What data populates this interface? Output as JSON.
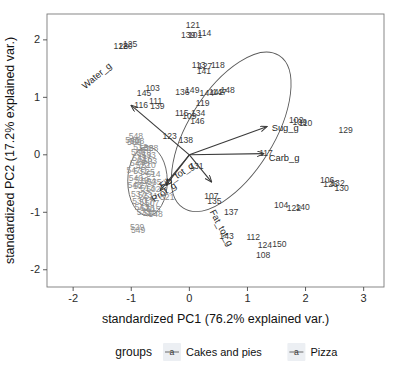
{
  "figure": {
    "type": "pca-biplot",
    "background": "#ffffff",
    "frame_color": "#7a7a7a"
  },
  "axes": {
    "x": {
      "title": "standardized PC1 (76.2% explained var.)",
      "ticks": [
        "-2",
        "-1",
        "0",
        "1",
        "2",
        "3"
      ],
      "tick_values": [
        -2,
        -1,
        0,
        1,
        2,
        3
      ],
      "range": [
        -2.45,
        3.35
      ]
    },
    "y": {
      "title": "standardized PC2 (17.2% explained var.)",
      "ticks": [
        "-2",
        "-1",
        "0",
        "1",
        "2"
      ],
      "tick_values": [
        -2,
        -1,
        0,
        1,
        2
      ],
      "range": [
        -2.3,
        2.45
      ]
    }
  },
  "legend": {
    "title": "groups",
    "items": [
      {
        "label": "Cakes and pies",
        "color": "#4d4d4d"
      },
      {
        "label": "Pizza",
        "color": "#9a9a9a"
      }
    ]
  },
  "chart_data": {
    "type": "scatter",
    "title": "",
    "xlabel": "standardized PC1 (76.2% explained var.)",
    "ylabel": "standardized PC2 (17.2% explained var.)",
    "xlim": [
      -2.45,
      3.35
    ],
    "ylim": [
      -2.3,
      2.45
    ],
    "grid": false,
    "legend_position": "bottom",
    "loadings": [
      {
        "name": "Water_g",
        "x": -1.0,
        "y": 0.86
      },
      {
        "name": "Sug_g",
        "x": 1.33,
        "y": 0.49
      },
      {
        "name": "Carb_g",
        "x": 1.28,
        "y": 0.02
      },
      {
        "name": "Fat_tot_g",
        "x": 0.38,
        "y": -0.47
      },
      {
        "name": "Fib_tot_g",
        "x": -0.4,
        "y": -0.53
      },
      {
        "name": "Prot_g",
        "x": -0.5,
        "y": -0.62
      }
    ],
    "ellipses": [
      {
        "group": "Cakes and pies",
        "cx": 0.72,
        "cy": 0.4,
        "rx": 1.55,
        "ry": 0.74,
        "angle": -58
      },
      {
        "group": "Pizza",
        "cx": -0.72,
        "cy": -0.46,
        "rx": 0.34,
        "ry": 0.6,
        "angle": 0
      }
    ],
    "series": [
      {
        "name": "Cakes and pies",
        "color": "#3a3a3a",
        "points": [
          {
            "label": "121",
            "x": 0.06,
            "y": 2.26
          },
          {
            "label": "114",
            "x": 0.26,
            "y": 2.12
          },
          {
            "label": "139",
            "x": -0.02,
            "y": 2.09
          },
          {
            "label": "101",
            "x": 0.1,
            "y": 2.09
          },
          {
            "label": "128",
            "x": -1.18,
            "y": 1.9
          },
          {
            "label": "120",
            "x": -1.1,
            "y": 1.9
          },
          {
            "label": "125",
            "x": -1.02,
            "y": 1.93
          },
          {
            "label": "113",
            "x": 0.16,
            "y": 1.57
          },
          {
            "label": "127",
            "x": 0.27,
            "y": 1.55
          },
          {
            "label": "118",
            "x": 0.49,
            "y": 1.56
          },
          {
            "label": "141",
            "x": 0.25,
            "y": 1.45
          },
          {
            "label": "103",
            "x": -0.63,
            "y": 1.16
          },
          {
            "label": "145",
            "x": -0.78,
            "y": 1.08
          },
          {
            "label": "136",
            "x": -0.12,
            "y": 1.1
          },
          {
            "label": "149",
            "x": 0.05,
            "y": 1.12
          },
          {
            "label": "144",
            "x": 0.3,
            "y": 1.08
          },
          {
            "label": "142",
            "x": 0.46,
            "y": 1.09
          },
          {
            "label": "147",
            "x": 0.52,
            "y": 1.09
          },
          {
            "label": "148",
            "x": 0.66,
            "y": 1.13
          },
          {
            "label": "116",
            "x": -0.83,
            "y": 0.86
          },
          {
            "label": "111",
            "x": -0.58,
            "y": 0.93
          },
          {
            "label": "139",
            "x": -0.55,
            "y": 0.85
          },
          {
            "label": "119",
            "x": 0.23,
            "y": 0.91
          },
          {
            "label": "115",
            "x": -0.13,
            "y": 0.72
          },
          {
            "label": "109",
            "x": 0.0,
            "y": 0.67
          },
          {
            "label": "134",
            "x": 0.15,
            "y": 0.73
          },
          {
            "label": "146",
            "x": 0.14,
            "y": 0.58
          },
          {
            "label": "102",
            "x": 1.84,
            "y": 0.61
          },
          {
            "label": "109",
            "x": 1.9,
            "y": 0.57
          },
          {
            "label": "110",
            "x": 2.0,
            "y": 0.55
          },
          {
            "label": "129",
            "x": 2.69,
            "y": 0.44
          },
          {
            "label": "123",
            "x": -0.34,
            "y": 0.33
          },
          {
            "label": "138",
            "x": -0.06,
            "y": 0.25
          },
          {
            "label": "117",
            "x": 1.32,
            "y": 0.03
          },
          {
            "label": "131",
            "x": 0.12,
            "y": -0.19
          },
          {
            "label": "106",
            "x": 2.37,
            "y": -0.44
          },
          {
            "label": "126",
            "x": 2.43,
            "y": -0.5
          },
          {
            "label": "132",
            "x": 2.55,
            "y": -0.49
          },
          {
            "label": "130",
            "x": 2.62,
            "y": -0.58
          },
          {
            "label": "107",
            "x": 0.38,
            "y": -0.72
          },
          {
            "label": "135",
            "x": 0.43,
            "y": -0.8
          },
          {
            "label": "104",
            "x": 1.58,
            "y": -0.87
          },
          {
            "label": "122",
            "x": 1.8,
            "y": -0.92
          },
          {
            "label": "140",
            "x": 1.95,
            "y": -0.91
          },
          {
            "label": "137",
            "x": 0.72,
            "y": -0.99
          },
          {
            "label": "143",
            "x": 0.64,
            "y": -1.42
          },
          {
            "label": "112",
            "x": 1.1,
            "y": -1.43
          },
          {
            "label": "124",
            "x": 1.3,
            "y": -1.57
          },
          {
            "label": "150",
            "x": 1.55,
            "y": -1.56
          },
          {
            "label": "108",
            "x": 1.27,
            "y": -1.75
          }
        ]
      },
      {
        "name": "Pizza",
        "color": "#9a9a9a",
        "points": [
          {
            "label": "548",
            "x": -0.92,
            "y": 0.33
          },
          {
            "label": "545",
            "x": -0.98,
            "y": 0.25
          },
          {
            "label": "508",
            "x": -0.9,
            "y": 0.24
          },
          {
            "label": "509",
            "x": -0.95,
            "y": 0.22
          },
          {
            "label": "512",
            "x": -0.84,
            "y": 0.13
          },
          {
            "label": "538",
            "x": -0.74,
            "y": 0.12
          },
          {
            "label": "528",
            "x": -0.66,
            "y": 0.11
          },
          {
            "label": "506",
            "x": -0.88,
            "y": 0.05
          },
          {
            "label": "518",
            "x": -0.78,
            "y": 0.03
          },
          {
            "label": "533",
            "x": -0.7,
            "y": 0.0
          },
          {
            "label": "541",
            "x": -0.86,
            "y": -0.05
          },
          {
            "label": "516",
            "x": -0.76,
            "y": -0.07
          },
          {
            "label": "503",
            "x": -0.68,
            "y": -0.1
          },
          {
            "label": "544",
            "x": -0.9,
            "y": -0.14
          },
          {
            "label": "522",
            "x": -0.8,
            "y": -0.17
          },
          {
            "label": "510",
            "x": -0.7,
            "y": -0.18
          },
          {
            "label": "547",
            "x": -0.96,
            "y": -0.26
          },
          {
            "label": "531",
            "x": -0.84,
            "y": -0.28
          },
          {
            "label": "525",
            "x": -0.72,
            "y": -0.3
          },
          {
            "label": "514",
            "x": -0.62,
            "y": -0.33
          },
          {
            "label": "540",
            "x": -0.92,
            "y": -0.4
          },
          {
            "label": "519",
            "x": -0.82,
            "y": -0.44
          },
          {
            "label": "504",
            "x": -0.7,
            "y": -0.45
          },
          {
            "label": "535",
            "x": -0.6,
            "y": -0.47
          },
          {
            "label": "546",
            "x": -0.94,
            "y": -0.53
          },
          {
            "label": "527",
            "x": -0.84,
            "y": -0.55
          },
          {
            "label": "513",
            "x": -0.72,
            "y": -0.57
          },
          {
            "label": "502",
            "x": -0.62,
            "y": -0.6
          },
          {
            "label": "521",
            "x": -0.38,
            "y": -0.73
          },
          {
            "label": "537",
            "x": -0.88,
            "y": -0.68
          },
          {
            "label": "523",
            "x": -0.76,
            "y": -0.7
          },
          {
            "label": "511",
            "x": -0.66,
            "y": -0.72
          },
          {
            "label": "530",
            "x": -0.86,
            "y": -0.8
          },
          {
            "label": "517",
            "x": -0.74,
            "y": -0.82
          },
          {
            "label": "507",
            "x": -0.64,
            "y": -0.84
          },
          {
            "label": "543",
            "x": -0.82,
            "y": -0.9
          },
          {
            "label": "526",
            "x": -0.72,
            "y": -0.93
          },
          {
            "label": "515",
            "x": -0.62,
            "y": -0.95
          },
          {
            "label": "532",
            "x": -0.78,
            "y": -1.0
          },
          {
            "label": "520",
            "x": -0.68,
            "y": -1.02
          },
          {
            "label": "548",
            "x": -0.58,
            "y": -1.03
          },
          {
            "label": "529",
            "x": -0.9,
            "y": -1.25
          },
          {
            "label": "549",
            "x": -0.88,
            "y": -1.3
          }
        ]
      }
    ]
  }
}
